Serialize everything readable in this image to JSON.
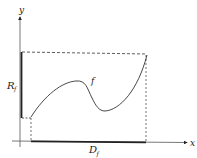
{
  "diagram": {
    "type": "function-domain-range",
    "labels": {
      "y_axis": "y",
      "x_axis": "x",
      "range": "R",
      "range_sub": "f",
      "domain": "D",
      "domain_sub": "f",
      "function": "f"
    },
    "colors": {
      "stroke": "#222222",
      "background": "#ffffff"
    }
  }
}
